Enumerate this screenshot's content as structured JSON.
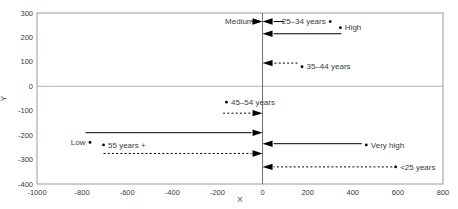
{
  "chart_data": {
    "type": "scatter",
    "title": "",
    "xlabel": "X",
    "ylabel": "Y",
    "xlim": [
      -1000,
      800
    ],
    "ylim": [
      -400,
      300
    ],
    "x_ticks": [
      -1000,
      -800,
      -600,
      -400,
      -200,
      0,
      200,
      400,
      600,
      800
    ],
    "y_ticks": [
      300,
      200,
      100,
      0,
      -100,
      -200,
      -300,
      -400
    ],
    "grid": false,
    "legend": "none",
    "zero_lines": true,
    "points": [
      {
        "label": "Medium",
        "x": -20,
        "y": 265,
        "label_side": "left"
      },
      {
        "label": "25–34 years",
        "x": 300,
        "y": 265,
        "label_side": "left"
      },
      {
        "label": "High",
        "x": 345,
        "y": 240,
        "label_side": "right"
      },
      {
        "label": "35–44 years",
        "x": 175,
        "y": 80,
        "label_side": "right"
      },
      {
        "label": "45–54 years",
        "x": -160,
        "y": -65,
        "label_side": "right"
      },
      {
        "label": "Low",
        "x": -765,
        "y": -230,
        "label_side": "left"
      },
      {
        "label": "55 years +",
        "x": -705,
        "y": -240,
        "label_side": "right"
      },
      {
        "label": "Very high",
        "x": 460,
        "y": -240,
        "label_side": "right"
      },
      {
        "label": "<25 years",
        "x": 590,
        "y": -330,
        "label_side": "right"
      }
    ],
    "arrows": [
      {
        "for": "Medium",
        "style": "solid",
        "y": 265,
        "x_from": -15,
        "x_to": 0,
        "direction": "right"
      },
      {
        "for": "25–34 years",
        "style": "solid",
        "y": 265,
        "x_from": 95,
        "x_to": 0,
        "direction": "left"
      },
      {
        "for": "High",
        "style": "solid",
        "y": 215,
        "x_from": 350,
        "x_to": 0,
        "direction": "left"
      },
      {
        "for": "35–44 years",
        "style": "dashed",
        "y": 95,
        "x_from": 155,
        "x_to": 0,
        "direction": "left"
      },
      {
        "for": "45–54 years",
        "style": "dashed",
        "y": -110,
        "x_from": -175,
        "x_to": 0,
        "direction": "right"
      },
      {
        "for": "Low",
        "style": "solid",
        "y": -190,
        "x_from": -785,
        "x_to": 0,
        "direction": "right"
      },
      {
        "for": "55 years +",
        "style": "dashed",
        "y": -275,
        "x_from": -705,
        "x_to": 0,
        "direction": "right"
      },
      {
        "for": "Very high",
        "style": "solid",
        "y": -235,
        "x_from": 440,
        "x_to": 0,
        "direction": "left"
      },
      {
        "for": "<25 years",
        "style": "dashed",
        "y": -330,
        "x_from": 575,
        "x_to": 0,
        "direction": "left"
      }
    ],
    "colors": {
      "ink": "#000000",
      "plot_border": "#9a9a9a",
      "zero_line_horizontal": "#b3b3b3",
      "zero_line_vertical": "#6e6e6e",
      "text": "#3a3a3a"
    }
  }
}
